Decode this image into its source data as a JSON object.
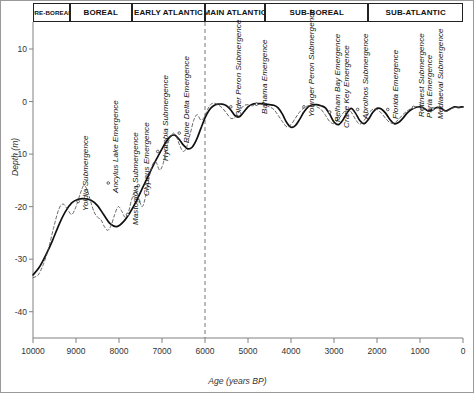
{
  "figure": {
    "axis_color": "#808080",
    "curve_color": "#111111",
    "dashed_curve_color": "#555555",
    "divider_color": "#777777"
  },
  "periods": {
    "header_label": "Chronozones",
    "items": [
      {
        "label": "PRE-BOREAL",
        "start": 10000,
        "end": 9150,
        "small": true
      },
      {
        "label": "BOREAL",
        "start": 9150,
        "end": 7700,
        "small": false
      },
      {
        "label": "EARLY ATLANTIC",
        "start": 7700,
        "end": 6000,
        "small": false
      },
      {
        "label": "MAIN ATLANTIC",
        "start": 6000,
        "end": 4600,
        "small": false
      },
      {
        "label": "SUB-BOREAL",
        "start": 4600,
        "end": 2200,
        "small": false
      },
      {
        "label": "SUB-ATLANTIC",
        "start": 2200,
        "end": 0,
        "small": false
      }
    ]
  },
  "chart_data": {
    "type": "line",
    "title": "",
    "xlabel": "Age (years BP)",
    "ylabel": "Depth (m)",
    "xlim": [
      10000,
      0
    ],
    "ylim": [
      -45,
      14
    ],
    "x_reversed": true,
    "grid": false,
    "legend": "none",
    "xticks": [
      10000,
      9000,
      8000,
      7000,
      6000,
      5000,
      4000,
      3000,
      2000,
      1000,
      0
    ],
    "xtick_labels": [
      "10000",
      "9000",
      "8000",
      "7000",
      "6000",
      "5000",
      "4000",
      "3000",
      "2000",
      "1000",
      "0"
    ],
    "yticks": [
      10,
      0,
      -10,
      -20,
      -30,
      -40
    ],
    "ytick_labels": [
      "10",
      "0",
      "-10",
      "-20",
      "-30",
      "-40"
    ],
    "annotations": {
      "vertical_divider_x": 6000,
      "vertical_divider_style": "dashed"
    },
    "series": [
      {
        "name": "Smoothed sea-level curve",
        "style": "solid",
        "x": [
          10000,
          9850,
          9700,
          9550,
          9400,
          9250,
          9100,
          8950,
          8800,
          8650,
          8500,
          8350,
          8200,
          8050,
          7900,
          7750,
          7600,
          7450,
          7300,
          7150,
          7000,
          6900,
          6800,
          6700,
          6600,
          6500,
          6400,
          6300,
          6200,
          6100,
          6000,
          5900,
          5800,
          5700,
          5600,
          5500,
          5400,
          5300,
          5200,
          5100,
          5000,
          4900,
          4800,
          4700,
          4600,
          4500,
          4400,
          4300,
          4200,
          4100,
          4000,
          3900,
          3800,
          3700,
          3600,
          3500,
          3400,
          3300,
          3200,
          3100,
          3000,
          2900,
          2800,
          2700,
          2600,
          2500,
          2400,
          2300,
          2200,
          2100,
          2000,
          1900,
          1800,
          1700,
          1600,
          1500,
          1400,
          1300,
          1200,
          1100,
          1000,
          900,
          800,
          700,
          600,
          500,
          400,
          300,
          200,
          100,
          0
        ],
        "y": [
          -33.0,
          -31.5,
          -29.2,
          -26.5,
          -23.5,
          -21.0,
          -19.3,
          -18.6,
          -18.5,
          -18.8,
          -19.8,
          -21.6,
          -23.3,
          -23.8,
          -22.9,
          -21.2,
          -19.0,
          -16.4,
          -13.8,
          -11.3,
          -9.0,
          -7.6,
          -6.6,
          -6.4,
          -7.2,
          -8.3,
          -9.0,
          -8.7,
          -7.3,
          -5.2,
          -3.1,
          -1.6,
          -0.8,
          -0.5,
          -0.5,
          -0.8,
          -1.6,
          -2.7,
          -2.9,
          -2.0,
          -1.0,
          -0.5,
          -0.4,
          -0.4,
          -0.5,
          -0.6,
          -0.7,
          -1.2,
          -2.4,
          -4.0,
          -4.9,
          -4.6,
          -3.4,
          -2.0,
          -1.0,
          -0.6,
          -0.6,
          -0.8,
          -1.2,
          -2.4,
          -3.9,
          -4.4,
          -3.6,
          -2.2,
          -1.3,
          -2.2,
          -3.6,
          -4.2,
          -3.4,
          -2.1,
          -1.3,
          -1.4,
          -2.2,
          -3.4,
          -4.2,
          -4.0,
          -3.2,
          -2.2,
          -1.5,
          -1.1,
          -1.0,
          -1.3,
          -1.8,
          -1.5,
          -1.1,
          -1.3,
          -1.8,
          -1.4,
          -1.0,
          -1.1,
          -1.0
        ]
      },
      {
        "name": "Detailed (oscillatory) sea-level curve",
        "style": "dashed",
        "x": [
          10000,
          9880,
          9760,
          9640,
          9520,
          9400,
          9300,
          9200,
          9100,
          9000,
          8900,
          8820,
          8740,
          8660,
          8580,
          8500,
          8420,
          8340,
          8260,
          8180,
          8100,
          8020,
          7940,
          7860,
          7780,
          7700,
          7620,
          7540,
          7460,
          7380,
          7300,
          7220,
          7140,
          7060,
          6980,
          6900,
          6820,
          6740,
          6660,
          6580,
          6500,
          6420,
          6340,
          6260,
          6180,
          6100,
          6020,
          5940,
          5860,
          5780,
          5700,
          5600,
          5500,
          5400,
          5300,
          5200,
          5100,
          5000,
          4900,
          4800,
          4700,
          4600,
          4500,
          4400,
          4300,
          4200,
          4100,
          4000,
          3900,
          3800,
          3700,
          3600,
          3500,
          3400,
          3300,
          3200,
          3100,
          3000,
          2900,
          2800,
          2700,
          2600,
          2500,
          2400,
          2300,
          2200,
          2100,
          2000,
          1900,
          1800,
          1700,
          1600,
          1500,
          1400,
          1300,
          1200,
          1100,
          1000,
          900,
          800,
          700,
          600,
          500,
          400,
          300,
          200,
          100,
          0
        ],
        "y": [
          -33.5,
          -33.0,
          -31.0,
          -28.0,
          -24.0,
          -20.5,
          -19.5,
          -20.5,
          -21.5,
          -20.0,
          -17.5,
          -16.0,
          -16.8,
          -19.0,
          -21.0,
          -22.0,
          -22.5,
          -23.8,
          -24.5,
          -23.5,
          -21.5,
          -20.0,
          -20.8,
          -22.0,
          -21.0,
          -18.5,
          -17.0,
          -18.5,
          -20.0,
          -18.0,
          -14.5,
          -12.0,
          -11.5,
          -13.0,
          -12.0,
          -9.0,
          -7.0,
          -6.0,
          -6.8,
          -8.5,
          -9.5,
          -8.5,
          -6.0,
          -3.5,
          -2.5,
          -3.5,
          -3.0,
          -1.5,
          -0.5,
          -0.3,
          -0.6,
          -1.2,
          -2.2,
          -3.2,
          -3.0,
          -1.8,
          -0.8,
          -0.6,
          -0.8,
          -0.6,
          -0.5,
          -0.7,
          -1.0,
          -1.5,
          -2.6,
          -3.8,
          -4.8,
          -4.4,
          -3.2,
          -2.0,
          -1.2,
          -0.8,
          -0.7,
          -1.0,
          -1.5,
          -2.6,
          -3.8,
          -4.2,
          -3.4,
          -2.3,
          -1.5,
          -2.0,
          -3.4,
          -4.3,
          -3.6,
          -2.3,
          -1.5,
          -1.5,
          -2.2,
          -3.2,
          -4.0,
          -4.1,
          -3.4,
          -2.5,
          -1.8,
          -1.3,
          -1.1,
          -1.1,
          -1.4,
          -1.9,
          -1.6,
          -1.2,
          -1.3,
          -1.9,
          -1.5,
          -1.1,
          -1.2,
          -1.1
        ]
      }
    ]
  },
  "events": [
    {
      "label": "Yoldia Submergence",
      "age": 8950,
      "depth": -19.0
    },
    {
      "label": "Ancylus Lake Emergence",
      "age": 8250,
      "depth": -15.5
    },
    {
      "label": "Mastogloia Submergence",
      "age": 7800,
      "depth": -21.5
    },
    {
      "label": "Clypeus Emergence",
      "age": 7550,
      "depth": -16.0
    },
    {
      "label": "Hydrobia Submergence",
      "age": 7100,
      "depth": -9.5
    },
    {
      "label": "Rhine Delta Emergence",
      "age": 6600,
      "depth": -6.0
    },
    {
      "label": "Older Peron Submergence",
      "age": 5400,
      "depth": -1.0
    },
    {
      "label": "Bahama Emergence",
      "age": 4800,
      "depth": -0.5
    },
    {
      "label": "Younger Peron Submergence",
      "age": 3700,
      "depth": -1.0
    },
    {
      "label": "Pelham Bay Emergence",
      "age": 3100,
      "depth": -2.0
    },
    {
      "label": "Crane Key Emergence",
      "age": 2900,
      "depth": -3.2
    },
    {
      "label": "Abrolhos Submergence",
      "age": 2450,
      "depth": -1.5
    },
    {
      "label": "Florida Emergence",
      "age": 1750,
      "depth": -1.5
    },
    {
      "label": "Rottnest Submergence",
      "age": 1150,
      "depth": -1.1
    },
    {
      "label": "Paria Emergence",
      "age": 950,
      "depth": -1.2
    },
    {
      "label": "Mediaeval Submergence",
      "age": 700,
      "depth": -1.4
    }
  ]
}
